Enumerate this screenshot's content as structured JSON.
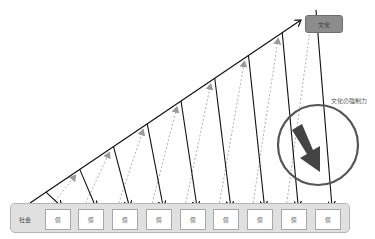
{
  "culture_box": {
    "label": "文化"
  },
  "force_label": "文化の強制力",
  "society": {
    "label": "社会",
    "individuals": [
      {
        "label": "個"
      },
      {
        "label": "個"
      },
      {
        "label": "個"
      },
      {
        "label": "個"
      },
      {
        "label": "個"
      },
      {
        "label": "個"
      },
      {
        "label": "個"
      },
      {
        "label": "個"
      },
      {
        "label": "個"
      }
    ]
  },
  "colors": {
    "line": "#111111",
    "dashed": "#b0b0b0",
    "gray_arrowhead": "#9a9a9a",
    "thick_arrow": "#444444",
    "circle": "#555555",
    "society_fill": "#e0e0e0",
    "culture_fill": "#8c8c8c"
  }
}
